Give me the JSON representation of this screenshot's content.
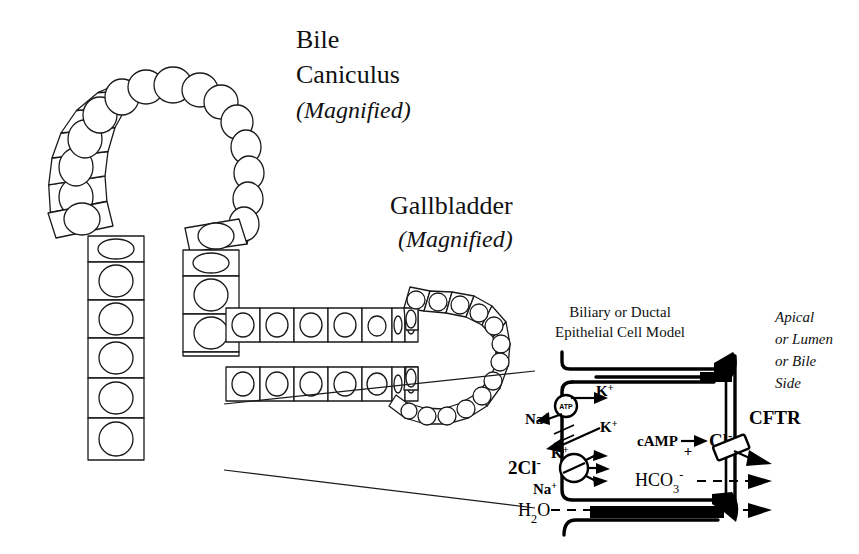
{
  "figure": {
    "background_color": "#ffffff",
    "ink_color": "#000000"
  },
  "labels": {
    "canaliculus_title_line1": "Bile",
    "canaliculus_title_line2": "Caniculus",
    "canaliculus_title_line3": "(Magnified)",
    "gallbladder_title_line1": "Gallbladder",
    "gallbladder_title_line2": "(Magnified)",
    "model_title_line1": "Biliary or Ductal",
    "model_title_line2": "Epithelial Cell Model",
    "apical_line1": "Apical",
    "apical_line2": "or Lumen",
    "apical_line3": "or Bile",
    "apical_line4": "Side"
  },
  "cell_model": {
    "pump_label": "ATP",
    "ions": {
      "k_top": "K",
      "k_top_charge": "+",
      "na_left": "Na",
      "na_left_charge": "+",
      "k_mid": "K",
      "k_mid_charge": "+",
      "k_low": "K",
      "k_low_charge": "+",
      "cl_cotransport": "2Cl",
      "cl_cotransport_charge": "-",
      "na_bottom": "Na",
      "na_bottom_charge": "+",
      "water": "H",
      "water_sub": "2",
      "water_o": "O",
      "camp": "cAMP",
      "camp_sign": "+",
      "chloride": "Cl",
      "chloride_charge": "-",
      "bicarbonate": "HCO",
      "bicarbonate_sub": "3",
      "bicarbonate_charge": "-",
      "channel": "CFTR"
    }
  },
  "structures": {
    "canaliculus_name": "bile-canaliculus-epithelium",
    "gallbladder_name": "gallbladder-epithelium",
    "duct_name": "duct-epithelium"
  }
}
